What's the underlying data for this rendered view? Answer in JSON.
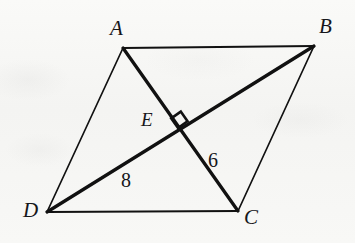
{
  "figure": {
    "type": "geometry-diagram",
    "shape": "parallelogram-with-diagonals",
    "background_color": "#f6f6f4",
    "stroke_color": "#111111",
    "vertices": [
      {
        "id": "A",
        "label": "A",
        "x": 123,
        "y": 48,
        "label_x": 110,
        "label_y": 18
      },
      {
        "id": "B",
        "label": "B",
        "x": 314,
        "y": 46,
        "label_x": 319,
        "label_y": 16
      },
      {
        "id": "C",
        "label": "C",
        "x": 238,
        "y": 211,
        "label_x": 244,
        "label_y": 207
      },
      {
        "id": "D",
        "label": "D",
        "x": 47,
        "y": 212,
        "label_x": 23,
        "label_y": 200
      }
    ],
    "interior_points": [
      {
        "id": "E",
        "label": "E",
        "x": 178,
        "y": 128,
        "label_x": 141,
        "label_y": 110
      }
    ],
    "sides": [
      {
        "id": "AB",
        "from": "A",
        "to": "B",
        "weight": 1.7
      },
      {
        "id": "BC",
        "from": "B",
        "to": "C",
        "weight": 1.7
      },
      {
        "id": "CD",
        "from": "C",
        "to": "D",
        "weight": 1.7
      },
      {
        "id": "DA",
        "from": "D",
        "to": "A",
        "weight": 1.7
      }
    ],
    "diagonals": [
      {
        "id": "AC",
        "from": "A",
        "to": "C",
        "weight": 3.2
      },
      {
        "id": "DB",
        "from": "D",
        "to": "B",
        "weight": 3.2
      }
    ],
    "right_angle_marker": {
      "id": "right-angle-at-E",
      "at_point": "E",
      "size": 13,
      "points": "178,128 187.5,121.2 180.8,111.6 171.2,118.4"
    },
    "measures": [
      {
        "id": "DE",
        "value": "8",
        "segment": "D-E",
        "label_x": 121,
        "label_y": 170
      },
      {
        "id": "EC",
        "value": "6",
        "segment": "E-C",
        "label_x": 208,
        "label_y": 150
      }
    ]
  }
}
